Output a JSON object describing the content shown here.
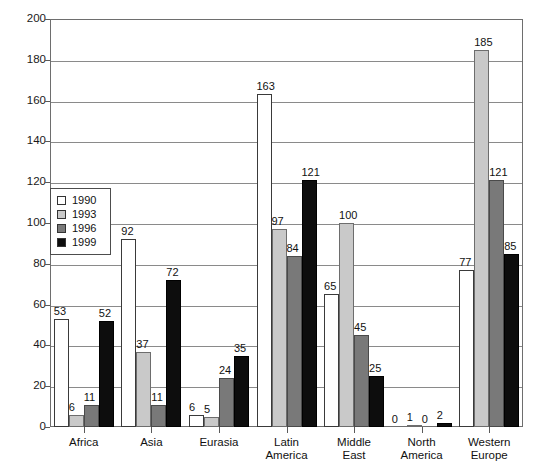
{
  "chart_data": {
    "type": "bar",
    "title": "",
    "xlabel": "",
    "ylabel": "",
    "ylim": [
      0,
      200
    ],
    "ytick_step": 20,
    "yticks": [
      0,
      20,
      40,
      60,
      80,
      100,
      120,
      140,
      160,
      180,
      200
    ],
    "grid": true,
    "legend_position": "upper-left-inside",
    "categories": [
      "Africa",
      "Asia",
      "Eurasia",
      "Latin\nAmerica",
      "Middle\nEast",
      "North\nAmerica",
      "Western\nEurope"
    ],
    "series": [
      {
        "name": "1990",
        "color": "#ffffff",
        "values": [
          53,
          92,
          6,
          163,
          65,
          0,
          77
        ]
      },
      {
        "name": "1993",
        "color": "#c9c9c9",
        "values": [
          6,
          37,
          5,
          97,
          100,
          1,
          185
        ]
      },
      {
        "name": "1996",
        "color": "#797979",
        "values": [
          11,
          11,
          24,
          84,
          45,
          0,
          121
        ]
      },
      {
        "name": "1999",
        "color": "#0d0d0d",
        "values": [
          52,
          72,
          35,
          121,
          25,
          2,
          85
        ]
      }
    ]
  },
  "legend": {
    "items": [
      {
        "label": "1990",
        "color": "#ffffff"
      },
      {
        "label": "1993",
        "color": "#c9c9c9"
      },
      {
        "label": "1996",
        "color": "#797979"
      },
      {
        "label": "1999",
        "color": "#0d0d0d"
      }
    ]
  }
}
